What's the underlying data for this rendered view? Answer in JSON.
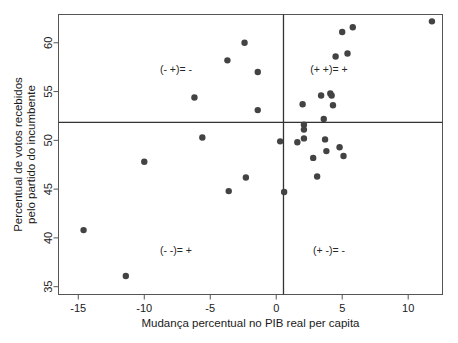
{
  "chart_data": {
    "type": "scatter",
    "title": "",
    "xlabel": "Mudança percentual no PIB real per capita",
    "ylabel": "Percentual de votos recebidos pelo partido do incumbente",
    "ylabel_line1": "Percentual de votos recebidos",
    "ylabel_line2": "pelo partido do incumbente",
    "xlim": [
      -16.5,
      12.6
    ],
    "ylim": [
      34.2,
      62.9
    ],
    "xticks": [
      -15,
      -10,
      -5,
      0,
      5,
      10
    ],
    "xtick_labels": [
      "-15",
      "-10",
      "-5",
      "0",
      "5",
      "10"
    ],
    "yticks": [
      35,
      40,
      45,
      50,
      55,
      60
    ],
    "ytick_labels": [
      "35",
      "40",
      "45",
      "50",
      "55",
      "60"
    ],
    "grid": false,
    "legend": "none",
    "marker_color": "#434343",
    "reference_lines": {
      "vertical_x": 0.55,
      "horizontal_y": 51.85,
      "color": "#333333"
    },
    "annotations": [
      {
        "text": "(- +)= -",
        "x": -7.6,
        "y": 56.9,
        "quadrant": "top-left"
      },
      {
        "text": "(+ +)= +",
        "x": 4.0,
        "y": 56.9,
        "quadrant": "top-right"
      },
      {
        "text": "(- -)= +",
        "x": -7.6,
        "y": 38.4,
        "quadrant": "bottom-left"
      },
      {
        "text": "(+ -)= -",
        "x": 4.0,
        "y": 38.4,
        "quadrant": "bottom-right"
      }
    ],
    "points": [
      {
        "x": -14.6,
        "y": 40.8
      },
      {
        "x": -11.4,
        "y": 36.1
      },
      {
        "x": -10.0,
        "y": 47.8
      },
      {
        "x": -6.2,
        "y": 54.4
      },
      {
        "x": -5.6,
        "y": 50.3
      },
      {
        "x": -3.7,
        "y": 58.2
      },
      {
        "x": -3.6,
        "y": 44.8
      },
      {
        "x": -2.4,
        "y": 60.0
      },
      {
        "x": -2.3,
        "y": 46.2
      },
      {
        "x": -1.4,
        "y": 57.0
      },
      {
        "x": -1.4,
        "y": 53.1
      },
      {
        "x": 0.3,
        "y": 49.9
      },
      {
        "x": 0.6,
        "y": 44.7
      },
      {
        "x": 1.6,
        "y": 49.8
      },
      {
        "x": 2.0,
        "y": 53.7
      },
      {
        "x": 2.1,
        "y": 51.6
      },
      {
        "x": 2.1,
        "y": 51.1
      },
      {
        "x": 2.1,
        "y": 50.2
      },
      {
        "x": 2.8,
        "y": 48.2
      },
      {
        "x": 3.1,
        "y": 46.3
      },
      {
        "x": 3.4,
        "y": 54.6
      },
      {
        "x": 3.6,
        "y": 52.2
      },
      {
        "x": 3.7,
        "y": 50.1
      },
      {
        "x": 3.8,
        "y": 48.9
      },
      {
        "x": 4.1,
        "y": 54.8
      },
      {
        "x": 4.2,
        "y": 54.6
      },
      {
        "x": 4.3,
        "y": 53.6
      },
      {
        "x": 4.5,
        "y": 58.6
      },
      {
        "x": 4.8,
        "y": 49.3
      },
      {
        "x": 5.0,
        "y": 61.1
      },
      {
        "x": 5.1,
        "y": 48.4
      },
      {
        "x": 5.4,
        "y": 58.9
      },
      {
        "x": 5.8,
        "y": 61.6
      },
      {
        "x": 11.8,
        "y": 62.2
      }
    ]
  }
}
